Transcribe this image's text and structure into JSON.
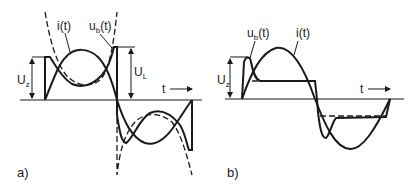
{
  "panel_a": {
    "label": "a)",
    "labels": {
      "current": "i(t)",
      "voltage_main": "u",
      "voltage_sub": "b",
      "voltage_arg": "(t)",
      "uz_main": "U",
      "uz_sub": "z",
      "ul_main": "U",
      "ul_sub": "L",
      "time": "t"
    }
  },
  "panel_b": {
    "label": "b)",
    "labels": {
      "current": "i(t)",
      "voltage_main": "u",
      "voltage_sub": "b",
      "voltage_arg": "(t)",
      "uz_main": "U",
      "uz_sub": "z",
      "time": "t"
    }
  }
}
